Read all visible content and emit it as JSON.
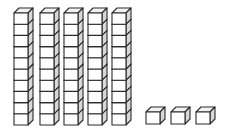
{
  "image": {
    "title": "Base Ten Blocks",
    "description": "Five vertical rods of ten stacked unit cubes and three loose unit cubes",
    "background_color": "#ffffff",
    "width": 226,
    "height": 138
  },
  "style": {
    "outline_color": "#2b2b2b",
    "front_face_color": "#ffffff",
    "top_face_color": "#f2f2f2",
    "side_face_color": "#d9d9d9",
    "stroke_width": 1.1
  },
  "geometry": {
    "cube_width": 14,
    "cube_height": 11.2,
    "depth_x": 5,
    "depth_y": 5,
    "unit_cube_width": 14,
    "unit_cube_height": 12
  },
  "chart_data": {
    "type": "bar",
    "categories": [
      "Rod 1",
      "Rod 2",
      "Rod 3",
      "Rod 4",
      "Rod 5",
      "Unit 1",
      "Unit 2",
      "Unit 3"
    ],
    "values": [
      10,
      10,
      10,
      10,
      10,
      1,
      1,
      1
    ],
    "xlabel": "",
    "ylabel": "Cubes",
    "ylim": [
      0,
      10
    ]
  },
  "blocks": {
    "tens_label": "tens rod",
    "ones_label": "unit cube",
    "tens_count": 5,
    "cubes_per_rod": 10,
    "ones_count": 3,
    "total_value": 53,
    "rods": [
      {
        "name": "tens-rod-1",
        "x": 14,
        "y_top": 13,
        "cubes": 10,
        "value": 10
      },
      {
        "name": "tens-rod-2",
        "x": 40,
        "y_top": 13,
        "cubes": 10,
        "value": 10
      },
      {
        "name": "tens-rod-3",
        "x": 64,
        "y_top": 13,
        "cubes": 10,
        "value": 10
      },
      {
        "name": "tens-rod-4",
        "x": 88,
        "y_top": 13,
        "cubes": 10,
        "value": 10
      },
      {
        "name": "tens-rod-5",
        "x": 112,
        "y_top": 13,
        "cubes": 10,
        "value": 10
      }
    ],
    "units": [
      {
        "name": "unit-cube-1",
        "x": 146,
        "y_top": 112,
        "value": 1
      },
      {
        "name": "unit-cube-2",
        "x": 171,
        "y_top": 112,
        "value": 1
      },
      {
        "name": "unit-cube-3",
        "x": 196,
        "y_top": 112,
        "value": 1
      }
    ]
  }
}
